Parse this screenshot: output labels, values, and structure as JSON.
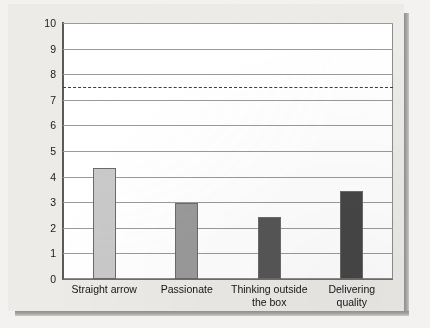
{
  "chart_data": {
    "type": "bar",
    "title": "",
    "xlabel": "",
    "ylabel": "",
    "categories": [
      "Straight arrow",
      "Passionate",
      "Thinking outside\nthe box",
      "Delivering\nquality"
    ],
    "values": [
      4.35,
      2.98,
      2.42,
      3.43
    ],
    "bar_colors": [
      "#c9c9c9",
      "#9a9a9a",
      "#565656",
      "#464646"
    ],
    "ylim": [
      0,
      10
    ],
    "yticks": [
      "0",
      "1",
      "2",
      "3",
      "4",
      "5",
      "6",
      "7",
      "8",
      "9",
      "10"
    ],
    "grid": true,
    "legend": "none",
    "annotations": [
      {
        "name": "reference-line",
        "type": "horizontal-dashed-line",
        "value": 7.5,
        "color": "#3a3a57"
      }
    ]
  },
  "colors": {
    "page_background": "#ecebe8",
    "plot_background": "#ffffff",
    "gridline": "#9a9a9a",
    "axis": "#5a5a5a",
    "text": "#141414"
  }
}
